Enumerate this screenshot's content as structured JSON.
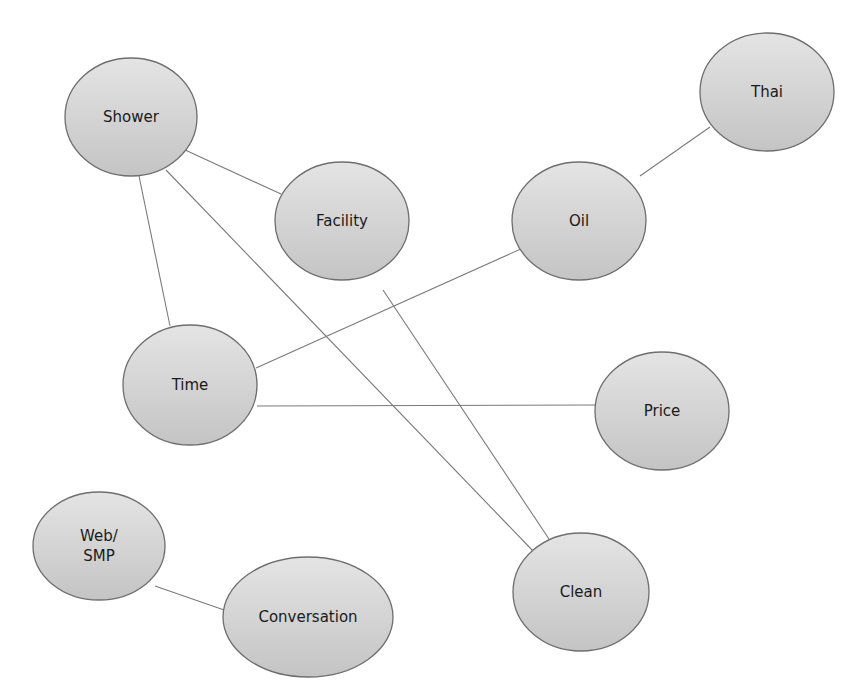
{
  "diagram": {
    "type": "concept-map",
    "colors": {
      "node_fill_top": "#e4e4e4",
      "node_fill_bottom": "#c4c4c4",
      "node_stroke": "#6e6e6e",
      "edge": "#7a7a7a",
      "text": "#1a1a1a",
      "background": "#ffffff"
    },
    "nodes": [
      {
        "id": "shower",
        "label": "Shower",
        "cx": 131,
        "cy": 117,
        "rx": 66,
        "ry": 59
      },
      {
        "id": "facility",
        "label": "Facility",
        "cx": 342,
        "cy": 221,
        "rx": 67,
        "ry": 59
      },
      {
        "id": "oil",
        "label": "Oil",
        "cx": 579,
        "cy": 221,
        "rx": 67,
        "ry": 59
      },
      {
        "id": "thai",
        "label": "Thai",
        "cx": 767,
        "cy": 92,
        "rx": 67,
        "ry": 59
      },
      {
        "id": "time",
        "label": "Time",
        "cx": 190,
        "cy": 385,
        "rx": 67,
        "ry": 60
      },
      {
        "id": "price",
        "label": "Price",
        "cx": 662,
        "cy": 411,
        "rx": 67,
        "ry": 59
      },
      {
        "id": "web_smp",
        "label_lines": [
          "Web/",
          "SMP"
        ],
        "cx": 99,
        "cy": 546,
        "rx": 66,
        "ry": 54
      },
      {
        "id": "conversation",
        "label": "Conversation",
        "cx": 308,
        "cy": 617,
        "rx": 85,
        "ry": 60
      },
      {
        "id": "clean",
        "label": "Clean",
        "cx": 581,
        "cy": 592,
        "rx": 68,
        "ry": 59
      }
    ],
    "edges": [
      {
        "from": "shower",
        "to": "facility",
        "x1": 183,
        "y1": 149,
        "x2": 281,
        "y2": 194
      },
      {
        "from": "shower",
        "to": "time",
        "x1": 139,
        "y1": 176,
        "x2": 170,
        "y2": 326
      },
      {
        "from": "shower",
        "to": "clean",
        "x1": 166,
        "y1": 170,
        "x2": 534,
        "y2": 552
      },
      {
        "from": "facility",
        "to": "clean",
        "x1": 383,
        "y1": 290,
        "x2": 549,
        "y2": 539
      },
      {
        "from": "oil",
        "to": "thai",
        "x1": 640,
        "y1": 176,
        "x2": 710,
        "y2": 127
      },
      {
        "from": "time",
        "to": "oil",
        "x1": 256,
        "y1": 368,
        "x2": 523,
        "y2": 248
      },
      {
        "from": "time",
        "to": "price",
        "x1": 257,
        "y1": 406,
        "x2": 596,
        "y2": 405
      },
      {
        "from": "web_smp",
        "to": "conversation",
        "x1": 155,
        "y1": 586,
        "x2": 227,
        "y2": 611
      }
    ]
  }
}
